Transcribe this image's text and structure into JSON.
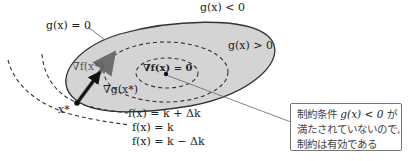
{
  "diagram": {
    "type": "constraint-optimization-illustration",
    "labels": {
      "region_outside": "g(x) < 0",
      "boundary": "g(x) = 0",
      "region_inside": "g(x) > 0",
      "grad_f_opt": "∇f(x*)",
      "grad_g_opt": "∇g(x*)",
      "grad_f_zero": "∇f(x) = 0",
      "opt_point": "x*",
      "contour_1": "f(x) = k + Δk",
      "contour_2": "f(x) = k",
      "contour_3": "f(x) = k − Δk"
    },
    "callout": {
      "line1_prefix": "制約条件",
      "line1_math": "g(x) < 0",
      "line1_suffix": "が",
      "line2": "満たされていないので,",
      "line3": "制約は有効である"
    },
    "colors": {
      "region_fill": "#d4d4d4",
      "boundary_stroke": "#333333",
      "dash_stroke": "#333333",
      "arrow_gray": "#6e6e6e",
      "arrow_black": "#111111",
      "callout_border": "#777777"
    }
  }
}
